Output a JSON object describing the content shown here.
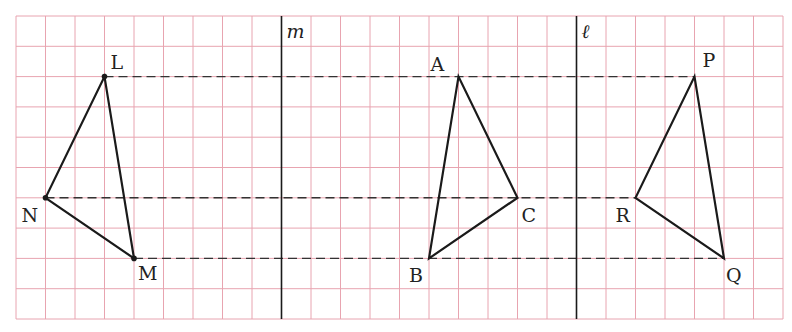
{
  "grid": {
    "origin_x": 16,
    "origin_y": 16,
    "cell_w": 29.5,
    "cell_h": 30.3,
    "cols": 26,
    "rows": 10,
    "line_color": "#e8a4b0",
    "bg": "#ffffff"
  },
  "axes": [
    {
      "name": "m",
      "label": "m",
      "col": 9
    },
    {
      "name": "l",
      "label": "ℓ",
      "col": 19
    }
  ],
  "triangles": [
    {
      "name": "LMN",
      "vertices": [
        {
          "label": "L",
          "col": 3,
          "row": 2,
          "dot": true,
          "dx": 6,
          "dy": -8
        },
        {
          "label": "M",
          "col": 4,
          "row": 8,
          "dot": true,
          "dx": 4,
          "dy": 22
        },
        {
          "label": "N",
          "col": 1,
          "row": 6,
          "dot": true,
          "dx": -24,
          "dy": 24
        }
      ]
    },
    {
      "name": "ABC",
      "vertices": [
        {
          "label": "A",
          "col": 15,
          "row": 2,
          "dot": false,
          "dx": -28,
          "dy": -6
        },
        {
          "label": "B",
          "col": 14,
          "row": 8,
          "dot": false,
          "dx": -20,
          "dy": 24
        },
        {
          "label": "C",
          "col": 17,
          "row": 6,
          "dot": false,
          "dx": 4,
          "dy": 24
        }
      ]
    },
    {
      "name": "PQR",
      "vertices": [
        {
          "label": "P",
          "col": 23,
          "row": 2,
          "dot": false,
          "dx": 8,
          "dy": -10
        },
        {
          "label": "Q",
          "col": 24,
          "row": 8,
          "dot": false,
          "dx": 2,
          "dy": 24
        },
        {
          "label": "R",
          "col": 21,
          "row": 6,
          "dot": false,
          "dx": -20,
          "dy": 24
        }
      ]
    }
  ],
  "dashed_lines": [
    {
      "row": 2,
      "from_col": 3,
      "to_col": 23
    },
    {
      "row": 6,
      "from_col": 1,
      "to_col": 21
    },
    {
      "row": 8,
      "from_col": 4,
      "to_col": 24
    }
  ],
  "colors": {
    "stroke": "#1a1a1a",
    "dash": "#333333"
  }
}
